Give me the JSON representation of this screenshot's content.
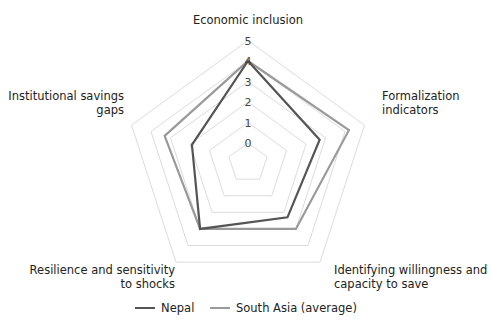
{
  "chart_data": {
    "type": "radar",
    "title": "",
    "axes": [
      {
        "label": [
          "Economic inclusion"
        ]
      },
      {
        "label": [
          "Formalization",
          "indicators"
        ]
      },
      {
        "label": [
          "Identifying willingness and",
          "capacity to save"
        ]
      },
      {
        "label": [
          "Resilience and sensitivity",
          "to shocks"
        ]
      },
      {
        "label": [
          "Institutional savings",
          "gaps"
        ]
      }
    ],
    "ticks": [
      "0",
      "1",
      "2",
      "3",
      "4",
      "5"
    ],
    "range": [
      0,
      5
    ],
    "grid": true,
    "series": [
      {
        "name": "Nepal",
        "color": "#555555",
        "values": [
          4.0,
          2.7,
          2.3,
          3.0,
          1.9
        ]
      },
      {
        "name": "South Asia (average)",
        "color": "#9a9a9a",
        "values": [
          4.0,
          4.2,
          3.0,
          3.0,
          3.3
        ]
      }
    ],
    "legend_position": "bottom"
  }
}
